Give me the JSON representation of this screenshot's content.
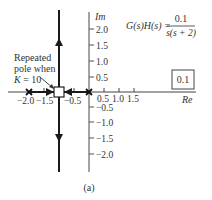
{
  "figure": {
    "caption": "(a)",
    "equation": {
      "lhs": "G(s)H(s) =",
      "numerator": "0.1",
      "denominator": "s(s + 2)"
    },
    "gain_box": "0.1",
    "axes": {
      "re_label": "Re",
      "im_label": "Im",
      "re_ticks_neg": [
        "−2.0",
        "−1.5",
        "−0.5"
      ],
      "re_ticks_pos": [
        "0.5",
        "1.0",
        "1.5"
      ],
      "im_ticks_pos": [
        "2.0",
        "1.5",
        "1.0",
        "0.5"
      ],
      "im_ticks_neg": [
        "−0.5",
        "−1.0",
        "−1.5",
        "−2.0"
      ]
    },
    "annotation": {
      "line1": "Repeated",
      "line2": "pole when",
      "line3_var": "K",
      "line3_rest": " = 10"
    },
    "poles": [
      {
        "re": 0,
        "im": 0,
        "marker": "x"
      },
      {
        "re": -2,
        "im": 0,
        "marker": "x"
      }
    ],
    "breakaway_point": {
      "re": -1,
      "im": 0,
      "marker": "square"
    },
    "colors": {
      "locus": "#222222",
      "axis": "#555555",
      "text": "#333333"
    }
  }
}
